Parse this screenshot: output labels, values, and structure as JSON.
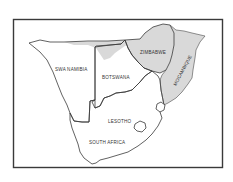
{
  "map": {
    "type": "outline map",
    "region": "Southern Africa",
    "colors": {
      "background": "#ffffff",
      "frame": "#3a3a3a",
      "border_line": "#4a4a4a",
      "shaded": "#d9d9d9"
    },
    "labels": {
      "swa_namibia": "SWA NAMIBIA",
      "botswana": "BOTSWANA",
      "zimbabwe": "ZIMBABWE",
      "mocambique": "MOCAMBIQUE",
      "lesotho": "LESOTHO",
      "south_africa": "SOUTH AFRICA"
    },
    "shaded_regions": [
      "ZIMBABWE",
      "MOCAMBIQUE",
      "northern strip of SWA NAMIBIA and BOTSWANA"
    ]
  }
}
